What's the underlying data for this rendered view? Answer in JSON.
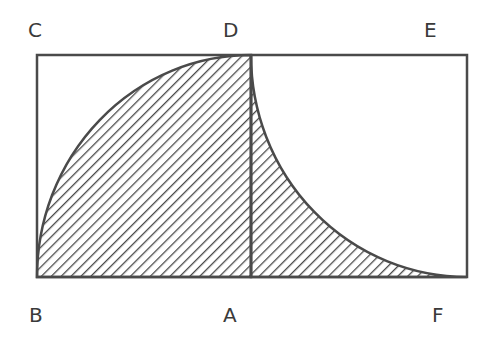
{
  "labels": {
    "C": "C",
    "D": "D",
    "E": "E",
    "B": "B",
    "A": "A",
    "F": "F"
  },
  "colors": {
    "stroke": "#4a4a4a",
    "hatch": "#4a4a4a",
    "background": "#ffffff"
  }
}
